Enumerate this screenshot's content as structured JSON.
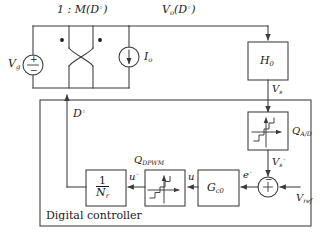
{
  "diagram": {
    "power_stage": {
      "transformer_ratio_label": "1 : M(D°)",
      "source_label": "Vg",
      "current_source_label": "Io",
      "output_label": "Vo(D°)",
      "duty_label": "D°"
    },
    "blocks": {
      "h0": "H0",
      "gc0": "Gc0",
      "invnr_num": "1",
      "invnr_den": "Nr",
      "qad": "QA/D",
      "qdpwm": "QDPWM"
    },
    "signals": {
      "vs": "Vs",
      "vs_quant": "Vs°",
      "vref": "Vref",
      "error": "e°",
      "u": "u",
      "u_quant": "u°"
    },
    "labels": {
      "digital_controller": "Digital controller",
      "sum_minus": "−",
      "sum_plus": "+",
      "source_plus": "+",
      "source_minus": "−"
    },
    "colors": {
      "line": "#3a3a3a",
      "text": "#1a1a1a",
      "background": "#ffffff"
    }
  }
}
